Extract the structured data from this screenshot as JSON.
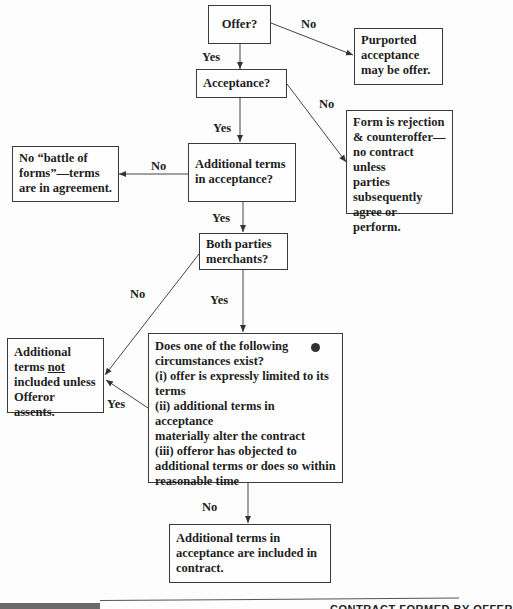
{
  "nodes": {
    "offer": {
      "text": "Offer?"
    },
    "purported": {
      "lines": [
        "Purported",
        "acceptance",
        "may be offer."
      ]
    },
    "acceptance": {
      "text": "Acceptance?"
    },
    "rejection": {
      "lines": [
        "Form is rejection",
        "& counteroffer—",
        "no contract unless",
        "parties",
        "subsequently",
        "agree or perform."
      ]
    },
    "no_battle": {
      "lines": [
        "No “battle of",
        "forms”—terms",
        "are in agreement."
      ]
    },
    "additional_terms": {
      "lines": [
        "Additional terms",
        "in acceptance?"
      ]
    },
    "both_merchants": {
      "lines": [
        "Both parties",
        "merchants?"
      ]
    },
    "not_included": {
      "line1": "Additional",
      "line2_pre": "terms ",
      "line2_underlined": "not",
      "line3": "included unless",
      "line4": "Offeror assents."
    },
    "circumstances": {
      "lines": [
        "Does one of the following",
        "circumstances exist?",
        "(i) offer is expressly limited to its",
        "terms",
        "(ii) additional terms in acceptance",
        "materially alter the contract",
        "(iii) offeror has objected to",
        "additional terms or does so within",
        "reasonable time"
      ]
    },
    "included": {
      "lines": [
        "Additional terms in",
        "acceptance are included in",
        "contract."
      ]
    }
  },
  "edge_labels": {
    "offer_no": "No",
    "offer_yes": "Yes",
    "acceptance_no": "No",
    "acceptance_yes": "Yes",
    "additional_no": "No",
    "additional_yes": "Yes",
    "merchants_no": "No",
    "merchants_yes": "Yes",
    "circumstances_yes": "Yes",
    "circumstances_no": "No"
  },
  "footer": {
    "text": "CONTRACT FORMED BY OFFER"
  }
}
